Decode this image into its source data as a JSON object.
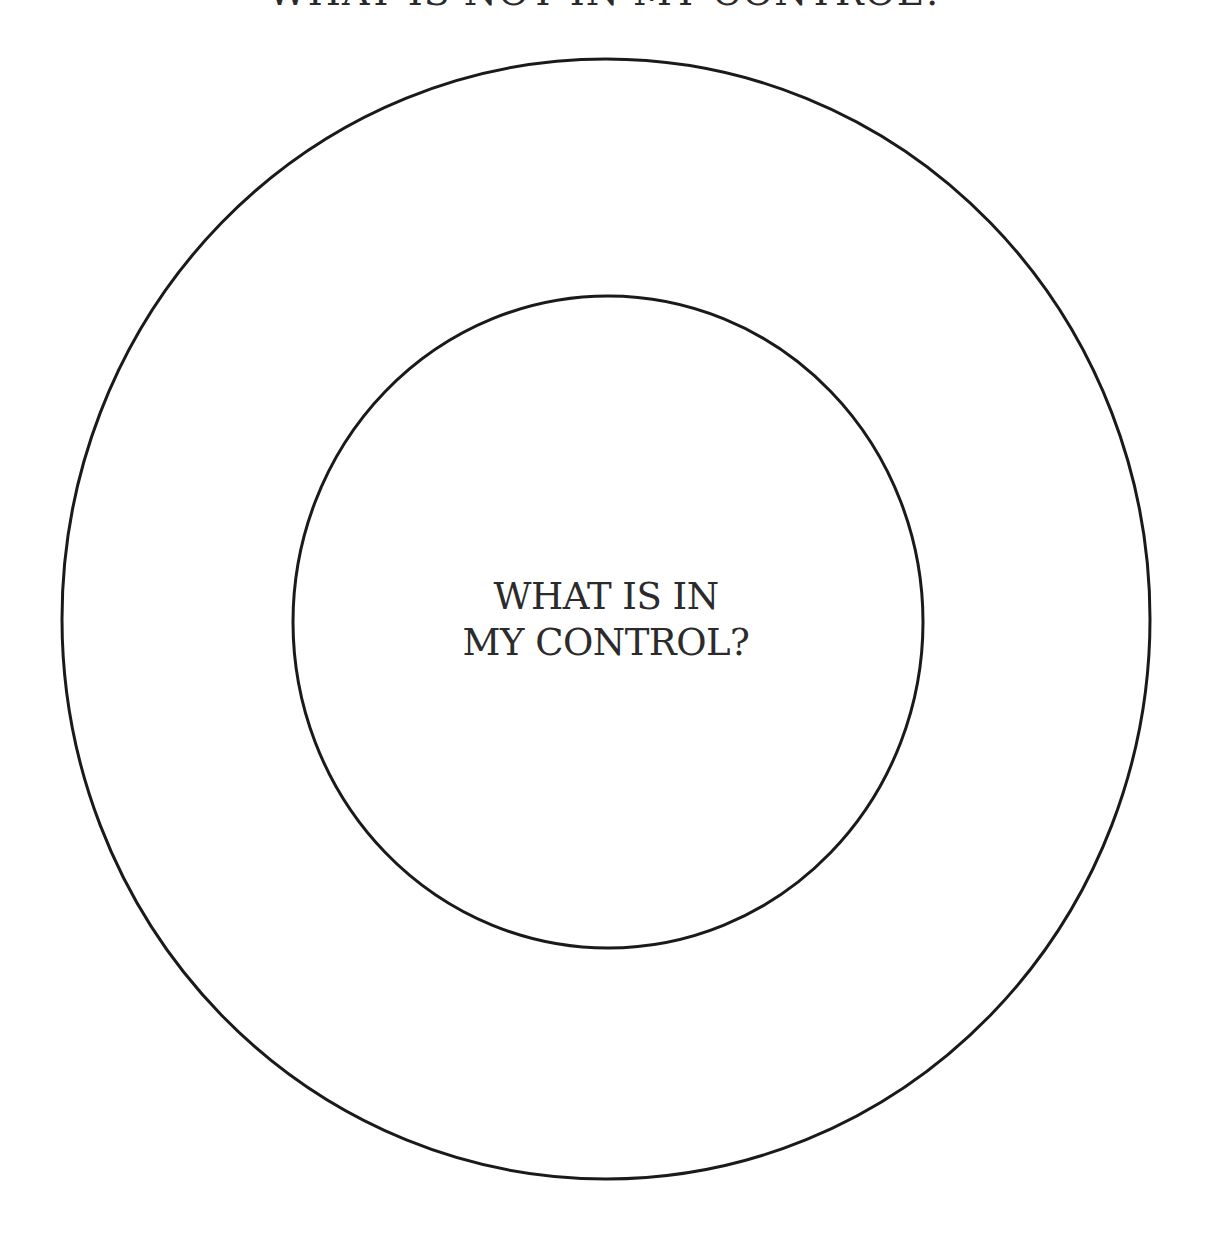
{
  "diagram": {
    "type": "concentric-circles",
    "outer_circle": {
      "label": "WHAT IS NOT IN MY CONTROL?",
      "center": [
        606,
        619
      ],
      "radius": 544
    },
    "inner_circle": {
      "label_lines": [
        "WHAT IS IN",
        "MY CONTROL?"
      ],
      "center": [
        608,
        622
      ],
      "radius": 316
    },
    "stroke_color": "#1a1a1a",
    "background_color": "#ffffff"
  }
}
